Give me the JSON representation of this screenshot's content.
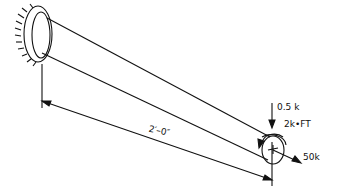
{
  "diagram": {
    "labels": {
      "axial_force": "0.5 k",
      "torque": "2k•FT",
      "transverse_force": "50k",
      "length": "2′–0″"
    },
    "colors": {
      "line": "#111111",
      "background": "#ffffff"
    }
  }
}
